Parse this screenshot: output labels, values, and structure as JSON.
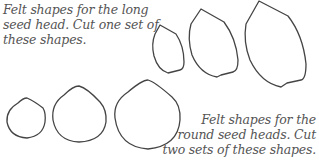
{
  "captions": {
    "long_seed_head": {
      "lines": [
        "Felt shapes for the long",
        "seed head. Cut one set of",
        "these shapes."
      ]
    },
    "round_seed_heads": {
      "lines": [
        "Felt shapes for the",
        "round seed heads. Cut",
        "two sets of these shapes."
      ]
    }
  },
  "shapes": {
    "long_seed_head": [
      {
        "label": "small",
        "size": "small"
      },
      {
        "label": "medium",
        "size": "medium"
      },
      {
        "label": "large",
        "size": "large"
      }
    ],
    "round_seed_head": [
      {
        "label": "small",
        "size": "small"
      },
      {
        "label": "medium",
        "size": "medium"
      },
      {
        "label": "large",
        "size": "large"
      }
    ]
  },
  "colors": {
    "outline": "#444444",
    "text": "#555555",
    "background": "#ffffff"
  }
}
